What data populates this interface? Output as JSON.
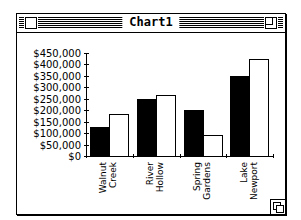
{
  "window": {
    "title": "Chart1"
  },
  "chart_data": {
    "type": "bar",
    "title": "",
    "xlabel": "",
    "ylabel": "",
    "categories": [
      "Walnut Creek",
      "River Hollow",
      "Spring Gardens",
      "Lake Newport"
    ],
    "category_lines": [
      [
        "Walnut",
        "Creek"
      ],
      [
        "River",
        "Hollow"
      ],
      [
        "Spring",
        "Gardens"
      ],
      [
        "Lake",
        "Newport"
      ]
    ],
    "series": [
      {
        "name": "Series 1",
        "color": "#000000",
        "values": [
          125000,
          250000,
          200000,
          350000
        ]
      },
      {
        "name": "Series 2",
        "color": "#ffffff",
        "values": [
          185000,
          265000,
          90000,
          425000
        ]
      }
    ],
    "ylim": [
      0,
      450000
    ],
    "yticks": [
      0,
      50000,
      100000,
      150000,
      200000,
      250000,
      300000,
      350000,
      400000,
      450000
    ],
    "ytick_labels": [
      "$0",
      "$50,000",
      "$100,000",
      "$150,000",
      "$200,000",
      "$250,000",
      "$300,000",
      "$350,000",
      "$400,000",
      "$450,000"
    ],
    "grid": false,
    "legend": "none"
  }
}
